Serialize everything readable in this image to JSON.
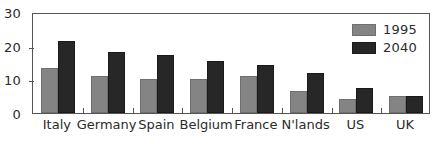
{
  "chart_data": {
    "type": "bar",
    "title": "",
    "subtitle": "",
    "xlabel": "",
    "ylabel": "",
    "ylim": [
      0,
      30
    ],
    "yticks": [
      0,
      10,
      20,
      30
    ],
    "grid": false,
    "legend_position": "top-right",
    "categories": [
      "Italy",
      "Germany",
      "Spain",
      "Belgium",
      "France",
      "N'lands",
      "US",
      "UK"
    ],
    "series": [
      {
        "name": "1995",
        "color": "#848484",
        "values": [
          13.4,
          11.0,
          10.2,
          10.2,
          11.0,
          6.4,
          4.2,
          5.2
        ]
      },
      {
        "name": "2040",
        "color": "#272727",
        "values": [
          21.4,
          18.2,
          17.2,
          15.4,
          14.4,
          11.9,
          7.5,
          5.2
        ]
      }
    ]
  },
  "colors": {
    "series_1995": "#848484",
    "series_2040": "#272727",
    "axis": "#555555",
    "text": "#2b2b2b",
    "background": "#ffffff"
  }
}
